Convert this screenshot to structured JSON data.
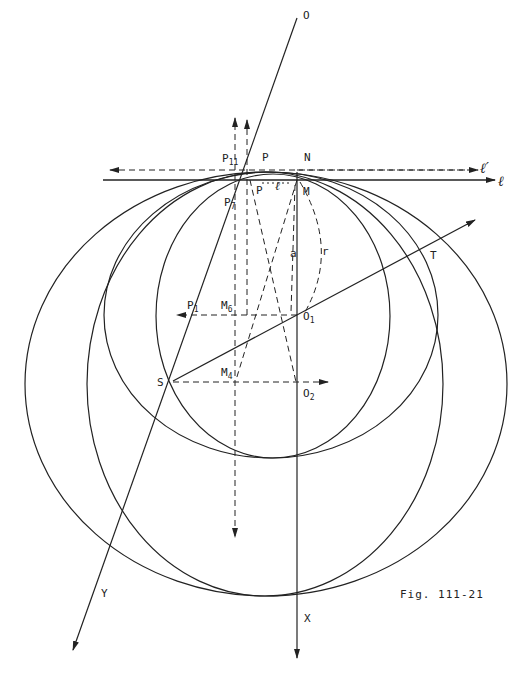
{
  "figure": {
    "caption": "Fig. 111-21",
    "stroke_color": "#222222",
    "background": "#ffffff"
  },
  "labels": {
    "O": "O",
    "N": "N",
    "M": "M",
    "P": "P",
    "P_prime": "P",
    "P11_base": "P",
    "P11_sub": "11",
    "P7_base": "P",
    "P7_sub": "7",
    "P1_base": "P",
    "P1_sub": "1",
    "M6_base": "M",
    "M6_sub": "6",
    "M4_base": "M",
    "M4_sub": "4",
    "O1_base": "O",
    "O1_sub": "1",
    "O2_base": "O",
    "O2_sub": "2",
    "S": "S",
    "T": "T",
    "X": "X",
    "Y": "Y",
    "a": "a",
    "r": "r",
    "ell": "ℓ",
    "ell_prime": "ℓ′",
    "ell_between": "ℓ"
  },
  "geometry": {
    "points": {
      "O": [
        297,
        18
      ],
      "N": [
        297,
        172
      ],
      "M": [
        297,
        180
      ],
      "P": [
        250,
        180
      ],
      "O1": [
        297,
        315
      ],
      "O2": [
        297,
        382
      ],
      "S": [
        173,
        381
      ]
    },
    "circles": [
      {
        "name": "circle-a",
        "cx": 273,
        "cy": 316,
        "rx": 117,
        "ry": 142
      },
      {
        "name": "circle-b",
        "cx": 271,
        "cy": 315,
        "rx": 167,
        "ry": 143
      },
      {
        "name": "circle-c",
        "cx": 265,
        "cy": 384,
        "rx": 178,
        "ry": 212
      },
      {
        "name": "circle-d",
        "cx": 266,
        "cy": 384,
        "rx": 241,
        "ry": 212
      }
    ]
  }
}
